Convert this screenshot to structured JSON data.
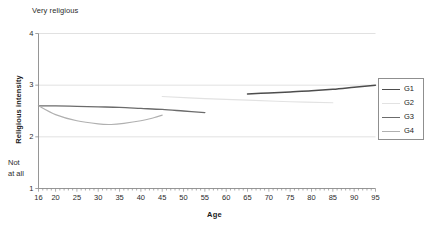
{
  "chart_data": {
    "type": "line",
    "title": "",
    "xlabel": "Age",
    "ylabel": "Religious intensity",
    "xlim": [
      16,
      95
    ],
    "ylim": [
      1,
      4
    ],
    "grid": "horizontal",
    "legend_position": "right",
    "y_axis_top_anchor": "Very religious",
    "y_axis_bottom_anchor_line1": "Not",
    "y_axis_bottom_anchor_line2": "at all",
    "yticks": [
      "1",
      "2",
      "3",
      "4"
    ],
    "ytick_values": [
      1,
      2,
      3,
      4
    ],
    "xticks": [
      "16",
      "20",
      "25",
      "30",
      "35",
      "40",
      "45",
      "50",
      "55",
      "60",
      "65",
      "70",
      "75",
      "80",
      "85",
      "90",
      "95"
    ],
    "xtick_values": [
      16,
      20,
      25,
      30,
      35,
      40,
      45,
      50,
      55,
      60,
      65,
      70,
      75,
      80,
      85,
      90,
      95
    ],
    "series": [
      {
        "name": "G1",
        "color": "#4d4d4d",
        "width": 1.5,
        "x": [
          65,
          70,
          75,
          80,
          85,
          90,
          95
        ],
        "values": [
          2.83,
          2.85,
          2.87,
          2.89,
          2.92,
          2.96,
          3.0
        ]
      },
      {
        "name": "G2",
        "color": "#e2e2e2",
        "width": 1.1,
        "x": [
          45,
          55,
          65,
          75,
          85
        ],
        "values": [
          2.78,
          2.74,
          2.71,
          2.68,
          2.66
        ]
      },
      {
        "name": "G3",
        "color": "#6b6b6b",
        "width": 1.3,
        "x": [
          16,
          20,
          25,
          30,
          35,
          40,
          45,
          50,
          55
        ],
        "values": [
          2.6,
          2.6,
          2.59,
          2.58,
          2.57,
          2.55,
          2.53,
          2.5,
          2.47
        ]
      },
      {
        "name": "G4",
        "color": "#b0b0b0",
        "width": 1.1,
        "x": [
          16,
          20,
          25,
          30,
          33,
          36,
          40,
          43,
          45
        ],
        "values": [
          2.6,
          2.43,
          2.31,
          2.25,
          2.24,
          2.26,
          2.31,
          2.37,
          2.42
        ]
      }
    ]
  },
  "legend": {
    "entries": [
      {
        "label": "G1"
      },
      {
        "label": "G2"
      },
      {
        "label": "G3"
      },
      {
        "label": "G4"
      }
    ]
  }
}
